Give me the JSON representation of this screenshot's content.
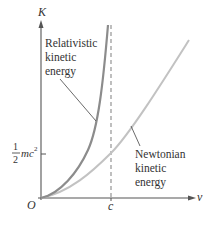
{
  "figure": {
    "axes": {
      "y_label": "K",
      "x_label": "v",
      "origin_label": "O",
      "x_tick_label": "c",
      "y_tick": {
        "numerator": "1",
        "denominator": "2",
        "term": "mc",
        "exponent": "2"
      }
    },
    "curves": {
      "relativistic": {
        "label_lines": [
          "Relativistic",
          "kinetic",
          "energy"
        ],
        "color": "#8c8c8c"
      },
      "newtonian": {
        "label_lines": [
          "Newtonian",
          "kinetic",
          "energy"
        ],
        "color": "#c2c2c2"
      }
    },
    "asymptote": {
      "at": "c",
      "style": "dashed",
      "color": "#8a8a8a"
    },
    "axis_color": "#555555"
  }
}
